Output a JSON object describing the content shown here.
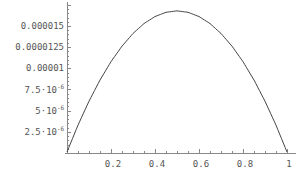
{
  "chart_data": {
    "type": "line",
    "title": "",
    "xlabel": "",
    "ylabel": "",
    "xlim": [
      0,
      1
    ],
    "ylim": [
      0,
      1.69e-05
    ],
    "grid": false,
    "legend": null,
    "x_ticks": [
      {
        "value": 0.2,
        "label": "0.2"
      },
      {
        "value": 0.4,
        "label": "0.4"
      },
      {
        "value": 0.6,
        "label": "0.6"
      },
      {
        "value": 0.8,
        "label": "0.8"
      },
      {
        "value": 1.0,
        "label": "1"
      }
    ],
    "y_ticks": [
      {
        "value": 2.5e-06,
        "label": "2.5·10",
        "exp": "-6"
      },
      {
        "value": 5e-06,
        "label": "5·10",
        "exp": "-6"
      },
      {
        "value": 7.5e-06,
        "label": "7.5·10",
        "exp": "-6"
      },
      {
        "value": 1e-05,
        "label": "0.00001",
        "exp": ""
      },
      {
        "value": 1.25e-05,
        "label": "0.0000125",
        "exp": ""
      },
      {
        "value": 1.5e-05,
        "label": "0.000015",
        "exp": ""
      }
    ],
    "series": [
      {
        "name": "curve",
        "x": [
          0,
          0.05,
          0.1,
          0.15,
          0.2,
          0.25,
          0.3,
          0.35,
          0.4,
          0.45,
          0.5,
          0.55,
          0.6,
          0.65,
          0.7,
          0.75,
          0.8,
          0.85,
          0.9,
          0.95,
          1.0
        ],
        "y": [
          0,
          3.17e-06,
          6e-06,
          8.5e-06,
          1.067e-05,
          1.25e-05,
          1.4e-05,
          1.517e-05,
          1.6e-05,
          1.65e-05,
          1.667e-05,
          1.65e-05,
          1.6e-05,
          1.517e-05,
          1.4e-05,
          1.25e-05,
          1.067e-05,
          8.5e-06,
          6e-06,
          3.17e-06,
          0
        ]
      }
    ]
  },
  "colors": {
    "curve": "#444444",
    "axis": "#888888",
    "tick_text": "#555555",
    "background": "#ffffff"
  }
}
